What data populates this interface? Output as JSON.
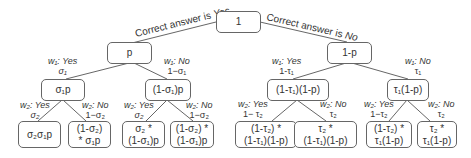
{
  "diagram": {
    "type": "probability-tree",
    "root": {
      "label": "1"
    },
    "top_edges": {
      "left": "Correct answer is Yes",
      "right_prefix": "Correct answer is ",
      "right_emph": "No",
      "left_prefix": "Correct answer is ",
      "left_emph": "Yes"
    },
    "level1": {
      "left": {
        "label": "p"
      },
      "right": {
        "label": "1-p"
      }
    },
    "level1_edges": {
      "ll": {
        "w": "w₁: ",
        "ans": "Yes",
        "prob": "σ₁"
      },
      "lr": {
        "w": "w₁: ",
        "ans": "No",
        "prob": "1−σ₁"
      },
      "rl": {
        "w": "w₁: ",
        "ans": "Yes",
        "prob": "1-τ₁"
      },
      "rr": {
        "w": "w₁: ",
        "ans": "No",
        "prob": "τ₁"
      }
    },
    "level2": {
      "n1": {
        "label": "σ₁p"
      },
      "n2": {
        "label": "(1-σ₁)p"
      },
      "n3": {
        "label": "(1-τ₁)(1-p)"
      },
      "n4": {
        "label": "τ₁(1-p)"
      }
    },
    "level2_edges": {
      "e1": {
        "w": "w₂: ",
        "ans": "Yes",
        "prob": "σ₂"
      },
      "e2": {
        "w": "w₂: ",
        "ans": "No",
        "prob": "1−σ₂"
      },
      "e3": {
        "w": "w₂: ",
        "ans": "Yes",
        "prob": "σ₂"
      },
      "e4": {
        "w": "w₂: ",
        "ans": "No",
        "prob": "1−σ₂"
      },
      "e5": {
        "w": "w₂: ",
        "ans": "Yes",
        "prob": "1− τ₂"
      },
      "e6": {
        "w": "w₂: ",
        "ans": "No",
        "prob": "τ₂"
      },
      "e7": {
        "w": "w₂: ",
        "ans": "Yes",
        "prob": "1−τ₂"
      },
      "e8": {
        "w": "w₂: ",
        "ans": "No",
        "prob": "τ₂"
      }
    },
    "leaves": {
      "l1": {
        "line1": "σ₂σ₁p",
        "line2": ""
      },
      "l2": {
        "line1": "(1-σ₂)",
        "line2": "* σ₁p"
      },
      "l3": {
        "line1": "σ₂ *",
        "line2": "(1-σ₁)p"
      },
      "l4": {
        "line1": "(1-σ₂) *",
        "line2": "(1-σ₁)p"
      },
      "l5": {
        "line1": "(1-τ₂) *",
        "line2": "(1-τ₁)(1-p)"
      },
      "l6": {
        "line1": "τ₂ *",
        "line2": "(1-τ₁)(1-p)"
      },
      "l7": {
        "line1": "(1-τ₂) *",
        "line2": "τ₁(1-p)"
      },
      "l8": {
        "line1": "τ₂ *",
        "line2": "τ₁(1-p)"
      }
    }
  }
}
